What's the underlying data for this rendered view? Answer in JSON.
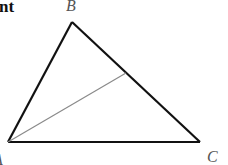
{
  "text_fragment": "nt",
  "figure": {
    "type": "triangle",
    "vertices": {
      "A": {
        "label": "A",
        "x": 8,
        "y": 142
      },
      "B": {
        "label": "B",
        "x": 72,
        "y": 22
      },
      "C": {
        "label": "C",
        "x": 200,
        "y": 142
      }
    },
    "cevian": {
      "from": "A",
      "to_point_on": "BC",
      "x": 126,
      "y": 73
    },
    "colors": {
      "sides": "#111111",
      "cevian": "#8a8a8a",
      "labels": "#555555"
    }
  }
}
